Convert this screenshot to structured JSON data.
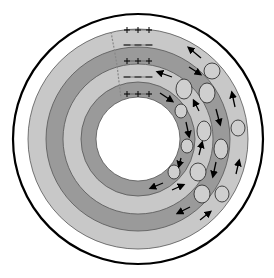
{
  "diagram": {
    "type": "concentric-rings-cross-section",
    "center": [
      138,
      139
    ],
    "outer_boundary_radius": 125,
    "colors": {
      "background": "#ffffff",
      "outline": "#000000",
      "light_band": "#c8c8c8",
      "dark_band": "#9a9a9a",
      "ellipse_fill": "#cfcfcf",
      "hole": "#ffffff"
    },
    "bands": [
      {
        "name": "outer-light-band",
        "r_outer": 110,
        "r_inner": 92,
        "shade": "light"
      },
      {
        "name": "outer-dark-band",
        "r_outer": 92,
        "r_inner": 75,
        "shade": "dark"
      },
      {
        "name": "inner-light-band",
        "r_outer": 75,
        "r_inner": 57,
        "shade": "light"
      },
      {
        "name": "inner-dark-band",
        "r_outer": 57,
        "r_inner": 42,
        "shade": "dark"
      }
    ],
    "charge_labels": [
      {
        "sign": "+",
        "row": "top-outer",
        "text": "+ + +"
      },
      {
        "sign": "-",
        "row": "outer-dark-top",
        "text": "– – –"
      },
      {
        "sign": "+",
        "row": "inner-light-top",
        "text": "+ + +"
      },
      {
        "sign": "-",
        "row": "inner-dark-top",
        "text": "– – –"
      },
      {
        "sign": "+",
        "row": "hole-edge-top",
        "text": "+ + +"
      }
    ],
    "ellipses": [
      {
        "cx": 212,
        "cy": 71,
        "rx": 8,
        "ry": 8
      },
      {
        "cx": 184,
        "cy": 89,
        "rx": 8,
        "ry": 10
      },
      {
        "cx": 207,
        "cy": 93,
        "rx": 8,
        "ry": 10
      },
      {
        "cx": 238,
        "cy": 128,
        "rx": 7,
        "ry": 8
      },
      {
        "cx": 181,
        "cy": 111,
        "rx": 6,
        "ry": 7
      },
      {
        "cx": 204,
        "cy": 131,
        "rx": 7,
        "ry": 10
      },
      {
        "cx": 221,
        "cy": 149,
        "rx": 7,
        "ry": 10
      },
      {
        "cx": 187,
        "cy": 146,
        "rx": 6,
        "ry": 7
      },
      {
        "cx": 174,
        "cy": 172,
        "rx": 6,
        "ry": 7
      },
      {
        "cx": 198,
        "cy": 172,
        "rx": 8,
        "ry": 9
      },
      {
        "cx": 202,
        "cy": 194,
        "rx": 8,
        "ry": 9
      },
      {
        "cx": 222,
        "cy": 194,
        "rx": 7,
        "ry": 8
      }
    ],
    "arrows": [
      {
        "x1": 201,
        "y1": 58,
        "x2": 189,
        "y2": 48
      },
      {
        "x1": 189,
        "y1": 67,
        "x2": 200,
        "y2": 74
      },
      {
        "x1": 172,
        "y1": 77,
        "x2": 158,
        "y2": 72
      },
      {
        "x1": 160,
        "y1": 93,
        "x2": 172,
        "y2": 101
      },
      {
        "x1": 235,
        "y1": 107,
        "x2": 232,
        "y2": 93
      },
      {
        "x1": 199,
        "y1": 111,
        "x2": 194,
        "y2": 101
      },
      {
        "x1": 216,
        "y1": 109,
        "x2": 220,
        "y2": 124
      },
      {
        "x1": 186,
        "y1": 122,
        "x2": 189,
        "y2": 136
      },
      {
        "x1": 199,
        "y1": 155,
        "x2": 202,
        "y2": 143
      },
      {
        "x1": 216,
        "y1": 162,
        "x2": 213,
        "y2": 176
      },
      {
        "x1": 181,
        "y1": 158,
        "x2": 179,
        "y2": 166
      },
      {
        "x1": 236,
        "y1": 174,
        "x2": 239,
        "y2": 161
      },
      {
        "x1": 163,
        "y1": 183,
        "x2": 151,
        "y2": 188
      },
      {
        "x1": 172,
        "y1": 190,
        "x2": 183,
        "y2": 185
      },
      {
        "x1": 190,
        "y1": 207,
        "x2": 178,
        "y2": 213
      },
      {
        "x1": 200,
        "y1": 220,
        "x2": 210,
        "y2": 212
      }
    ],
    "pathway": {
      "description": "dashed gray boundary line crossing bands near top-left of charge rows",
      "points": [
        [
          111,
          32
        ],
        [
          114,
          48
        ],
        [
          117,
          65
        ],
        [
          119,
          82
        ],
        [
          121,
          98
        ]
      ]
    }
  }
}
